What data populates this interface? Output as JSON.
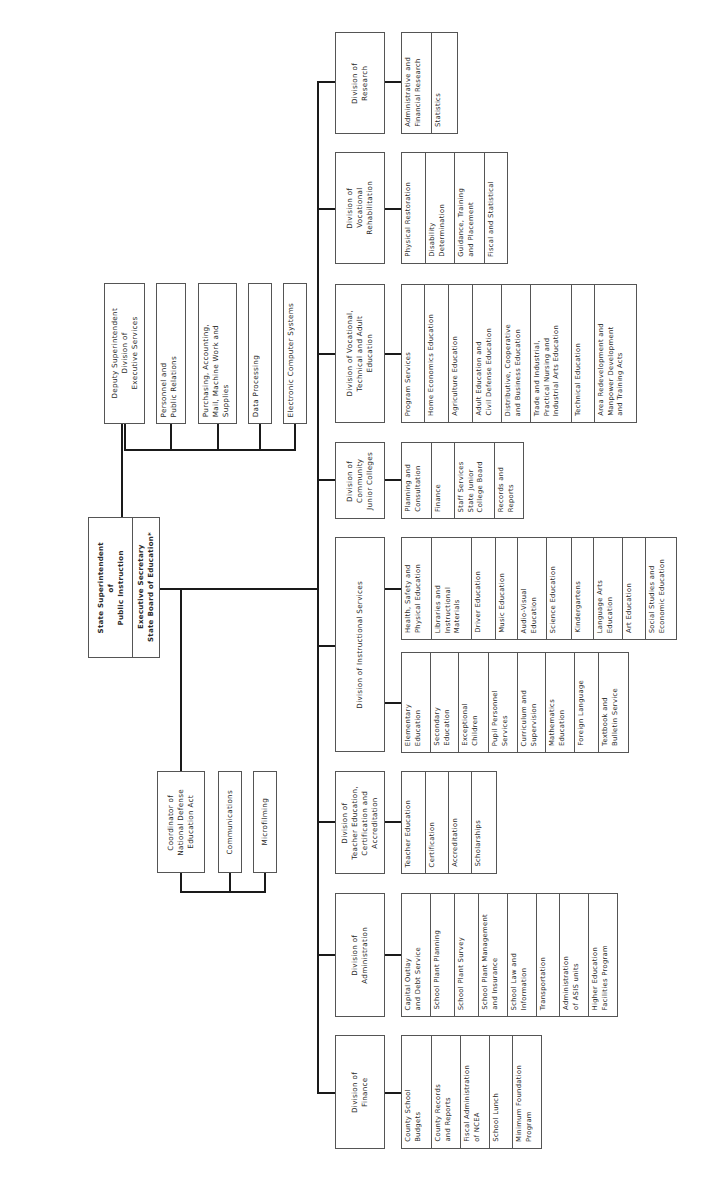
{
  "chart_title": "",
  "root": {
    "top": "State Superintendent\nof\nPublic Instruction",
    "bottom": "Executive Secretary\nState Board of Education*"
  },
  "deputy": {
    "title": "Deputy Superintendent\nDivision of\nExecutive Services",
    "units": [
      "Personnel and\nPublic Relations",
      "Purchasing, Accounting,\nMail, Machine Work and\nSupplies",
      "Data Processing",
      "Electronic Computer Systems"
    ]
  },
  "coordinator": {
    "title": "Coordinator of\nNational Defense\nEducation Act",
    "units": [
      "Communications",
      "Microfilming"
    ]
  },
  "divisions": {
    "research": {
      "title": "Division of\nResearch",
      "units": [
        "Administrative and\nFinancial Research",
        "Statistics"
      ]
    },
    "voc_rehab": {
      "title": "Division of\nVocational\nRehabilitation",
      "units": [
        "Physical Restoration",
        "Disability\nDetermination",
        "Guidance, Training\nand Placement",
        "Fiscal and Statistical"
      ]
    },
    "voc_tech_adult": {
      "title": "Division of Vocational,\nTechnical and Adult\nEducation",
      "units": [
        "Program Services",
        "Home Economics Education",
        "Agriculture Education",
        "Adult Education and\nCivil Defense Education",
        "Distributive, Cooperative\nand Business Education",
        "Trade and Industrial,\nPractical Nursing and\nIndustrial Arts Education",
        "Technical Education",
        "Area Redevelopment and\nManpower Development\nand Training Acts"
      ]
    },
    "community_jc": {
      "title": "Division of\nCommunity\nJunior Colleges",
      "units": [
        "Planning and\nConsultation",
        "Finance",
        "Staff Services\nState Junior\nCollege Board",
        "Records and\nReports"
      ]
    },
    "instructional": {
      "title": "Division of Instructional Services",
      "units_a": [
        "Health, Safety and\nPhysical Education",
        "Libraries and\nInstructional\nMaterials",
        "Driver Education",
        "Music Education",
        "Audio-Visual\nEducation",
        "Science Education",
        "Kindergartens",
        "Language Arts\nEducation",
        "Art Education",
        "Social Studies and\nEconomic Education"
      ],
      "units_b": [
        "Elementary\nEducation",
        "Secondary\nEducation",
        "Exceptional\nChildren",
        "Pupil Personnel\nServices",
        "Curriculum and\nSupervision",
        "Mathematics\nEducation",
        "Foreign Language",
        "Textbook and\nBulletin Service"
      ]
    },
    "teacher_ed": {
      "title": "Division of\nTeacher Education,\nCertification and\nAccreditation",
      "units": [
        "Teacher Education",
        "Certification",
        "Accreditation",
        "Scholarships"
      ]
    },
    "administration": {
      "title": "Division of\nAdministration",
      "units": [
        "Capital Outlay\nand Debt Service",
        "School Plant Planning",
        "School Plant Survey",
        "School Plant Management\nand Insurance",
        "School Law and\nInformation",
        "Transportation",
        "Administration\nof ASIS units",
        "Higher Education\nFacilities Program"
      ]
    },
    "finance": {
      "title": "Division of\nFinance",
      "units": [
        "County School\nBudgets",
        "County Records\nand Reports",
        "Fiscal Administration\nof NCEA",
        "School Lunch",
        "Minimum Foundation\nProgram"
      ]
    }
  }
}
